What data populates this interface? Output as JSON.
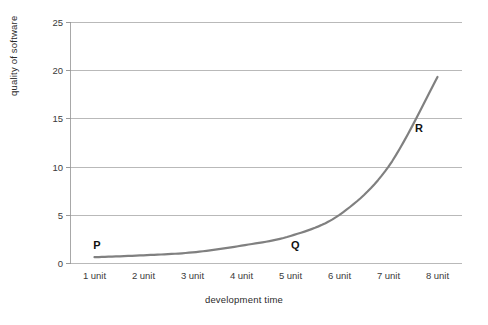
{
  "chart_data": {
    "type": "line",
    "title": "",
    "xlabel": "development time",
    "ylabel": "quality of software",
    "categories": [
      "1 unit",
      "2 unit",
      "3 unit",
      "4 unit",
      "5 unit",
      "6 unit",
      "7 unit",
      "8 unit"
    ],
    "values": [
      0.6,
      0.8,
      1.1,
      1.8,
      2.8,
      5.0,
      10.0,
      19.3
    ],
    "series": [
      {
        "name": "quality of software",
        "values": [
          0.6,
          0.8,
          1.1,
          1.8,
          2.8,
          5.0,
          10.0,
          19.3
        ]
      }
    ],
    "ylim": [
      0,
      25
    ],
    "yticks": [
      0,
      5,
      10,
      15,
      20,
      25
    ],
    "ytick_labels": [
      "0",
      "5",
      "10",
      "15",
      "20",
      "25"
    ],
    "grid": true,
    "legend": "none",
    "line_color": "#808080",
    "grid_color": "#b9b9b9",
    "axis_color": "#a8a8a8",
    "annotations": [
      {
        "label": "P",
        "x_category": "1 unit",
        "x_value": 1.05,
        "y_value": 1.9
      },
      {
        "label": "Q",
        "x_category": "5 unit",
        "x_value": 5.1,
        "y_value": 1.85
      },
      {
        "label": "R",
        "x_category": "8 unit",
        "x_value": 7.62,
        "y_value": 14.0
      }
    ]
  }
}
